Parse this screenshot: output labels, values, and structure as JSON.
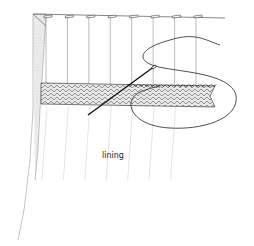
{
  "diagram": {
    "labels": [
      {
        "id": "lining",
        "text": "lining"
      }
    ],
    "parts": {
      "pleat_count": 8,
      "stitch_count": 16
    },
    "colors": {
      "ink": "#222222",
      "light_ink": "#9a9a9a",
      "hatch": "#555555",
      "paper": "#ffffff"
    }
  }
}
